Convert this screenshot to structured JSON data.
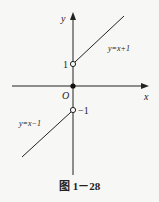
{
  "diagram": {
    "axes": {
      "x_label": "x",
      "y_label": "y",
      "origin_label": "O"
    },
    "ticks": {
      "y_pos": "1",
      "y_neg": "−1"
    },
    "curves": [
      {
        "label": "y=x+1",
        "domain": "x>0",
        "open_endpoint": [
          0,
          1
        ]
      },
      {
        "label": "y=x−1",
        "domain": "x<0",
        "open_endpoint": [
          0,
          -1
        ]
      }
    ],
    "filled_point": [
      0,
      0
    ],
    "caption": "图 1－28"
  }
}
